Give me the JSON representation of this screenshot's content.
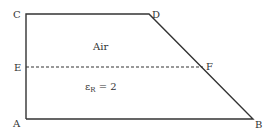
{
  "diagram": {
    "type": "geometry-region",
    "stroke_color": "#333333",
    "vertices": {
      "A": {
        "label": "A",
        "x": 26,
        "y": 119
      },
      "B": {
        "label": "B",
        "x": 253,
        "y": 119
      },
      "C": {
        "label": "C",
        "x": 26,
        "y": 14
      },
      "D": {
        "label": "D",
        "x": 149,
        "y": 14
      },
      "E": {
        "label": "E",
        "x": 26,
        "y": 67
      },
      "F": {
        "label": "F",
        "x": 203,
        "y": 67
      }
    },
    "regions": {
      "upper": {
        "label": "Air"
      },
      "lower": {
        "label_main": "ε",
        "label_sub": "R",
        "label_rest": " = 2"
      }
    },
    "interface_line": {
      "from": "E",
      "to": "F",
      "style": "dashed"
    }
  }
}
